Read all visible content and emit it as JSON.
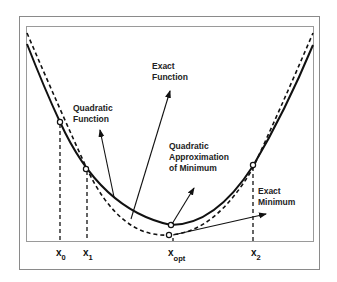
{
  "diagram": {
    "type": "quadratic-approximation-line-search",
    "colors": {
      "ink": "#111111",
      "frame": "#8a8a8a",
      "background": "#ffffff"
    },
    "labels": {
      "exact_function": [
        "Exact",
        "Function"
      ],
      "quadratic_function": [
        "Quadratic",
        "Function"
      ],
      "quadratic_approx_min": [
        "Quadratic",
        "Approximation",
        "of Minimum"
      ],
      "exact_minimum": [
        "Exact",
        "Minimum"
      ]
    },
    "axis_labels": {
      "x0": {
        "base": "x",
        "sub": "0"
      },
      "x1": {
        "base": "x",
        "sub": "1"
      },
      "xopt": {
        "base": "x",
        "sub": "opt"
      },
      "x2": {
        "base": "x",
        "sub": "2"
      }
    },
    "curves": [
      {
        "name": "Exact Function",
        "style": "solid"
      },
      {
        "name": "Quadratic Function",
        "style": "dashed"
      }
    ],
    "points": [
      "x0",
      "x1",
      "x2",
      "quadratic-min",
      "exact-min"
    ]
  }
}
